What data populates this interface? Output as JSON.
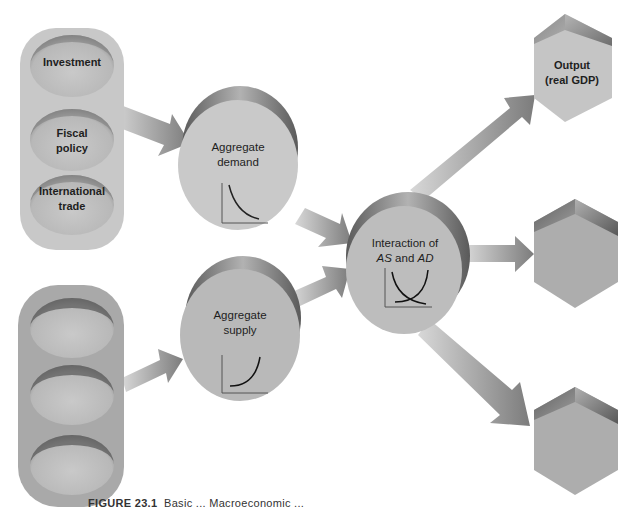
{
  "diagram": {
    "input_groups": [
      {
        "id": "demand-inputs",
        "items": [
          {
            "label_line1": "Investment",
            "label_line2": ""
          },
          {
            "label_line1": "Fiscal",
            "label_line2": "policy"
          },
          {
            "label_line1": "International",
            "label_line2": "trade"
          }
        ]
      },
      {
        "id": "supply-inputs",
        "items": [
          {
            "label_line1": "",
            "label_line2": ""
          },
          {
            "label_line1": "",
            "label_line2": ""
          },
          {
            "label_line1": "",
            "label_line2": ""
          }
        ]
      }
    ],
    "nodes": {
      "aggregate_demand": {
        "line1": "Aggregate",
        "line2": "demand",
        "chart": "downward-sloping-curve"
      },
      "aggregate_supply": {
        "line1": "Aggregate",
        "line2": "supply",
        "chart": "upward-sloping-curve"
      },
      "interaction": {
        "line1": "Interaction of",
        "line2_a": "AS",
        "line2_mid": " and ",
        "line2_b": "AD",
        "chart": "crossing-curves"
      }
    },
    "outputs": [
      {
        "line1": "Output",
        "line2": "(real GDP)"
      },
      {
        "line1": "",
        "line2": ""
      },
      {
        "line1": "",
        "line2": ""
      }
    ],
    "edges": [
      {
        "from": "demand-inputs",
        "to": "aggregate_demand"
      },
      {
        "from": "supply-inputs",
        "to": "aggregate_supply"
      },
      {
        "from": "aggregate_demand",
        "to": "interaction"
      },
      {
        "from": "aggregate_supply",
        "to": "interaction"
      },
      {
        "from": "interaction",
        "to": "output-1"
      },
      {
        "from": "interaction",
        "to": "output-2"
      },
      {
        "from": "interaction",
        "to": "output-3"
      }
    ]
  },
  "caption": {
    "figure_number": "FIGURE 23.1",
    "text": "Basic ... Macroeconomic ..."
  },
  "colors": {
    "pill": "#c9c9c9",
    "pill_dark": "#a9a9a9",
    "disc_face": "#c6c6c6",
    "disc_rim": "#7a7a7a",
    "arrow": "#9a9a9a",
    "hex_face": "#b3b3b3",
    "hex_top": "#6e6e6e"
  }
}
